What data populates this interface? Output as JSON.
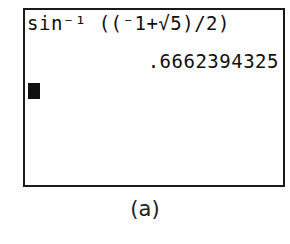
{
  "calculator_screen": {
    "expression": "sin⁻¹ ((⁻1+√5)/2)",
    "result": ".6662394325",
    "cursor": "block-cursor"
  },
  "caption": "(a)"
}
